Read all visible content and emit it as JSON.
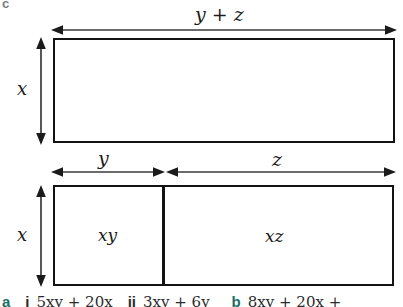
{
  "figure": {
    "part_letter": "c",
    "top_diagram": {
      "width_label": "y + z",
      "height_label": "x",
      "interior_label": ""
    },
    "bottom_diagram": {
      "left_width_label": "y",
      "right_width_label": "z",
      "height_label": "x",
      "left_area_label": "xy",
      "right_area_label": "xz"
    },
    "colors": {
      "stroke": "#131313",
      "arrow": "#3a3a3a",
      "text": "#1b1b1b",
      "part_letter": "#7d7d7d",
      "answer_label": "#1b6f63",
      "background": "#ffffff"
    }
  },
  "answers_strip": {
    "part_a_label": "a",
    "item_i_numeral": "i",
    "item_i_expression": "5xy + 20x",
    "item_ii_numeral": "ii",
    "item_ii_expression": "3xy + 6y",
    "part_b_label": "b",
    "part_b_expression": "8xy + 20x +"
  }
}
